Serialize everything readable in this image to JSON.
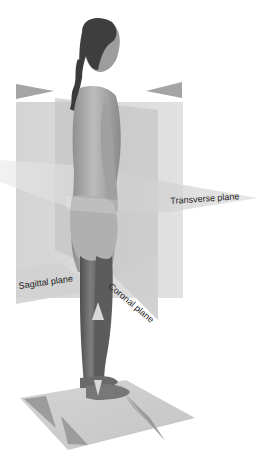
{
  "diagram": {
    "labels": {
      "transverse": "Transverse plane",
      "sagittal": "Sagittal plane",
      "coronal": "Coronal plane"
    },
    "colors": {
      "background": "#ffffff",
      "plane_fill": "#c8c8c8",
      "plane_fill_light": "#dcdcdc",
      "arrow_fill": "#9a9a9a",
      "figure_skin": "#b5b5b5",
      "figure_shadow": "#6e6e6e",
      "hair": "#3a3a3a",
      "label_text": "#222222"
    },
    "planes": [
      {
        "name": "sagittal",
        "label_key": "transverse"
      },
      {
        "name": "coronal"
      },
      {
        "name": "transverse"
      },
      {
        "name": "floor"
      }
    ]
  }
}
